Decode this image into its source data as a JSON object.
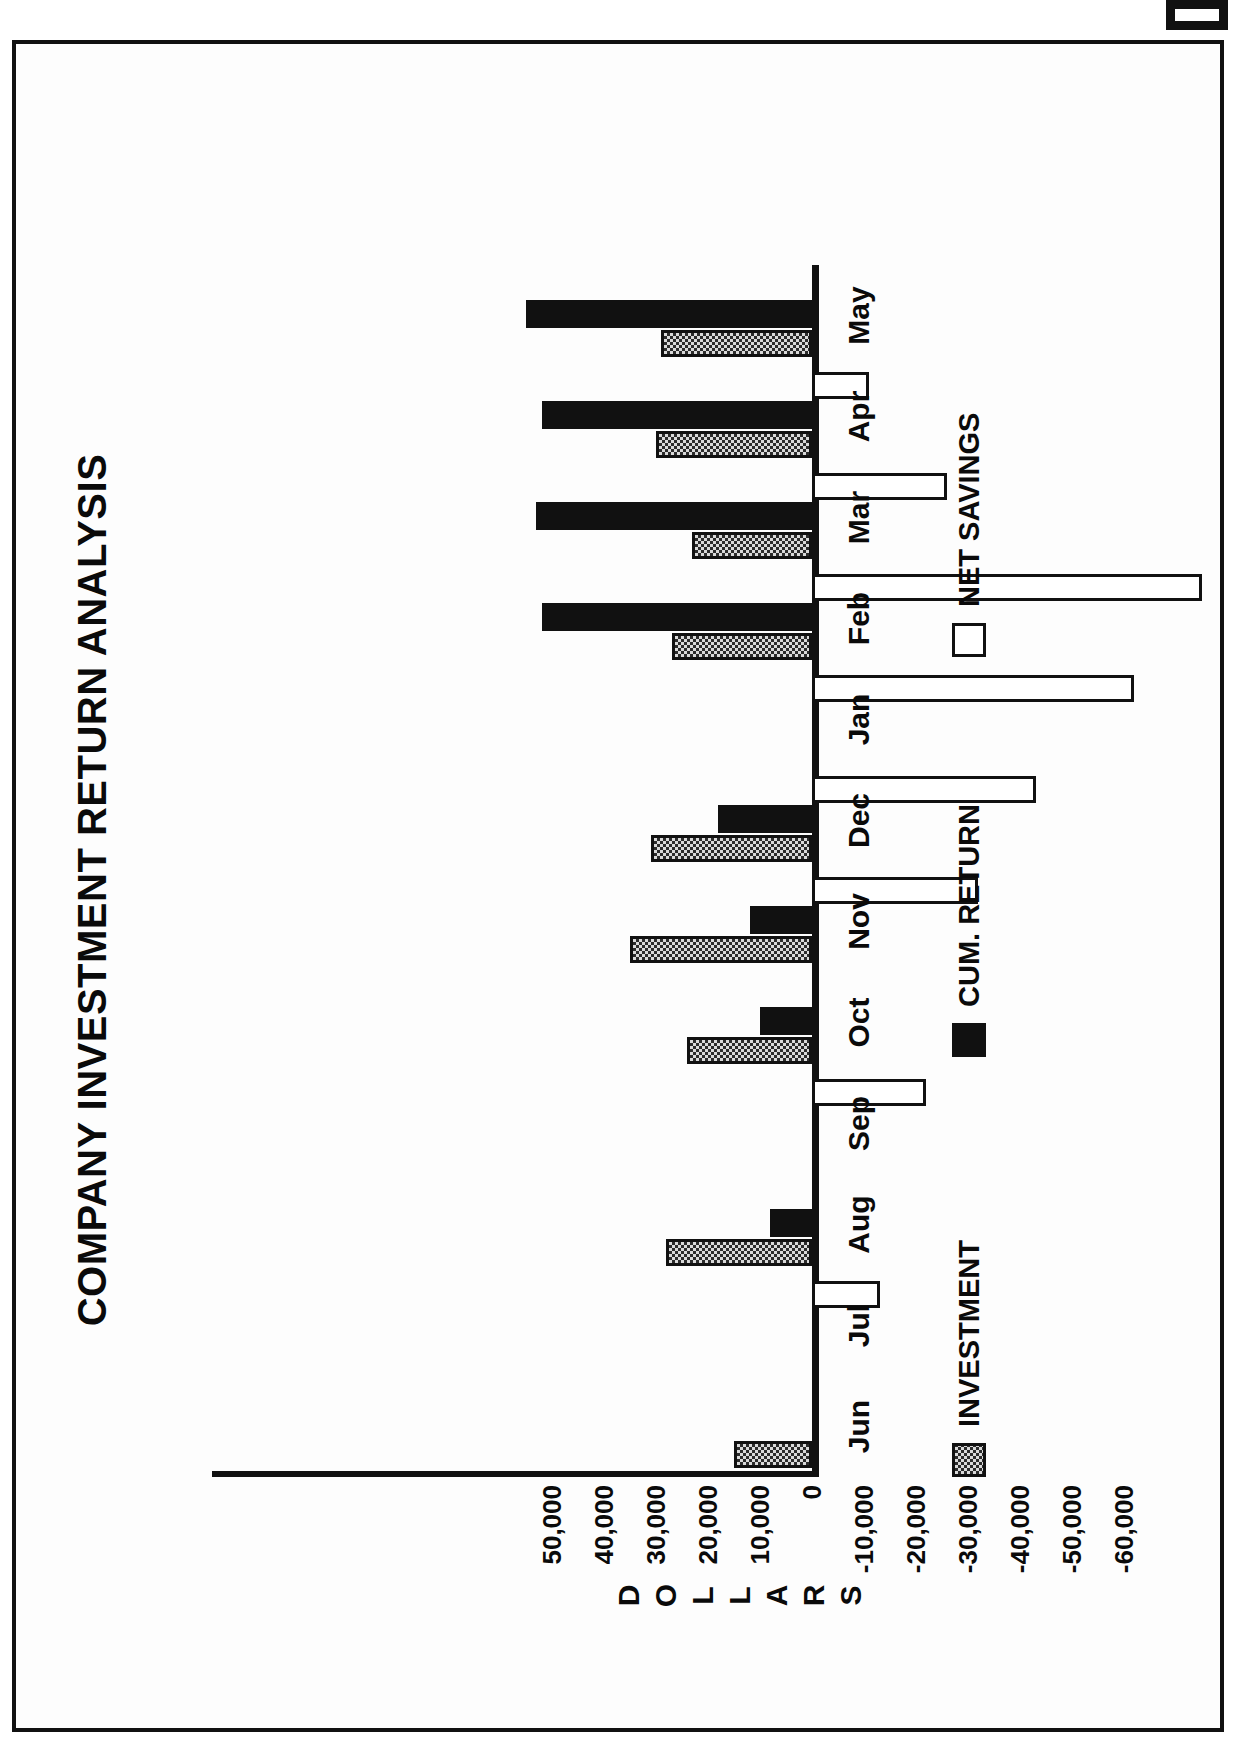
{
  "document": {
    "title": "COMPANY INVESTMENT RETURN ANALYSIS"
  },
  "chart_data": {
    "type": "bar",
    "orientation": "vertical-grouped",
    "title": "COMPANY INVESTMENT RETURN ANALYSIS",
    "xlabel": "",
    "ylabel": "DOLLARS",
    "categories": [
      "Jun",
      "Jul",
      "Aug",
      "Sep",
      "Oct",
      "Nov",
      "Dec",
      "Jan",
      "Feb",
      "Mar",
      "Apr",
      "May"
    ],
    "ylim": [
      -65000,
      55000
    ],
    "yticks": [
      50000,
      40000,
      30000,
      20000,
      10000,
      0,
      -10000,
      -20000,
      -30000,
      -40000,
      -50000,
      -60000
    ],
    "ytick_labels": [
      "50,000",
      "40,000",
      "30,000",
      "20,000",
      "10,000",
      "0",
      "-10,000",
      "-20,000",
      "-30,000",
      "-40,000",
      "-50,000",
      "-60,000"
    ],
    "grid": false,
    "legend_position": "bottom",
    "series": [
      {
        "name": "INVESTMENT",
        "fill": "dotted-gray",
        "values": [
          15000,
          28000,
          24000,
          35000,
          31000,
          27000,
          23000,
          30000,
          29000,
          0,
          0,
          0
        ]
      },
      {
        "name": "CUM. RETURN",
        "fill": "solid-black",
        "values": [
          0,
          8000,
          10000,
          12000,
          18000,
          30000,
          52000,
          53000,
          52000,
          0,
          0,
          0
        ]
      },
      {
        "name": "NET SAVINGS",
        "fill": "white",
        "values": [
          -13000,
          -22000,
          -32000,
          -43000,
          -62000,
          -75000,
          -26000,
          -11000,
          0,
          0,
          0,
          0
        ]
      }
    ],
    "bar_groups": [
      {
        "category": "Jun",
        "investment": 15000,
        "cum_return": 0,
        "net_savings": 0
      },
      {
        "category": "Jul",
        "investment": 0,
        "cum_return": 0,
        "net_savings": -13000
      },
      {
        "category": "Aug",
        "investment": 28000,
        "cum_return": 8000,
        "net_savings": 0
      },
      {
        "category": "Sep",
        "investment": 0,
        "cum_return": 0,
        "net_savings": -22000
      },
      {
        "category": "Oct",
        "investment": 24000,
        "cum_return": 10000,
        "net_savings": 0
      },
      {
        "category": "Nov",
        "investment": 35000,
        "cum_return": 12000,
        "net_savings": -32000
      },
      {
        "category": "Dec",
        "investment": 31000,
        "cum_return": 18000,
        "net_savings": -43000
      },
      {
        "category": "Jan",
        "investment": 0,
        "cum_return": 0,
        "net_savings": -62000
      },
      {
        "category": "Feb",
        "investment": 27000,
        "cum_return": 52000,
        "net_savings": -75000
      },
      {
        "category": "Mar",
        "investment": 23000,
        "cum_return": 53000,
        "net_savings": -26000
      },
      {
        "category": "Apr",
        "investment": 30000,
        "cum_return": 52000,
        "net_savings": -11000
      },
      {
        "category": "May",
        "investment": 29000,
        "cum_return": 55000,
        "net_savings": 0
      }
    ],
    "legend": [
      {
        "label": "INVESTMENT",
        "fill": "dotted-gray"
      },
      {
        "label": "CUM. RETURN",
        "fill": "solid-black"
      },
      {
        "label": "NET SAVINGS",
        "fill": "white"
      }
    ]
  },
  "colors": {
    "ink": "#111111",
    "paper": "#fdfdfd",
    "investment_fill": "#d9d9d9",
    "cum_return_fill": "#111111",
    "net_savings_fill": "#ffffff"
  }
}
